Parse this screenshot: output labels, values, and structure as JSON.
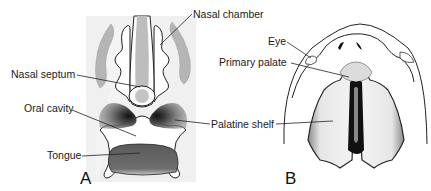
{
  "figure": {
    "panels": [
      {
        "id": "A",
        "letter": "A",
        "view": "coronal section",
        "labels": {
          "nasal_chamber": "Nasal chamber",
          "nasal_septum": "Nasal septum",
          "oral_cavity": "Oral cavity",
          "palatine_shelf": "Palatine shelf",
          "tongue": "Tongue"
        }
      },
      {
        "id": "B",
        "letter": "B",
        "view": "palatal view",
        "labels": {
          "eye": "Eye",
          "primary_palate": "Primary palate"
        }
      }
    ],
    "colors": {
      "line": "#1a1a1a",
      "light_gray": "#b8b8b8",
      "background_tint": "#efefef",
      "dark_gray": "#555555"
    }
  }
}
